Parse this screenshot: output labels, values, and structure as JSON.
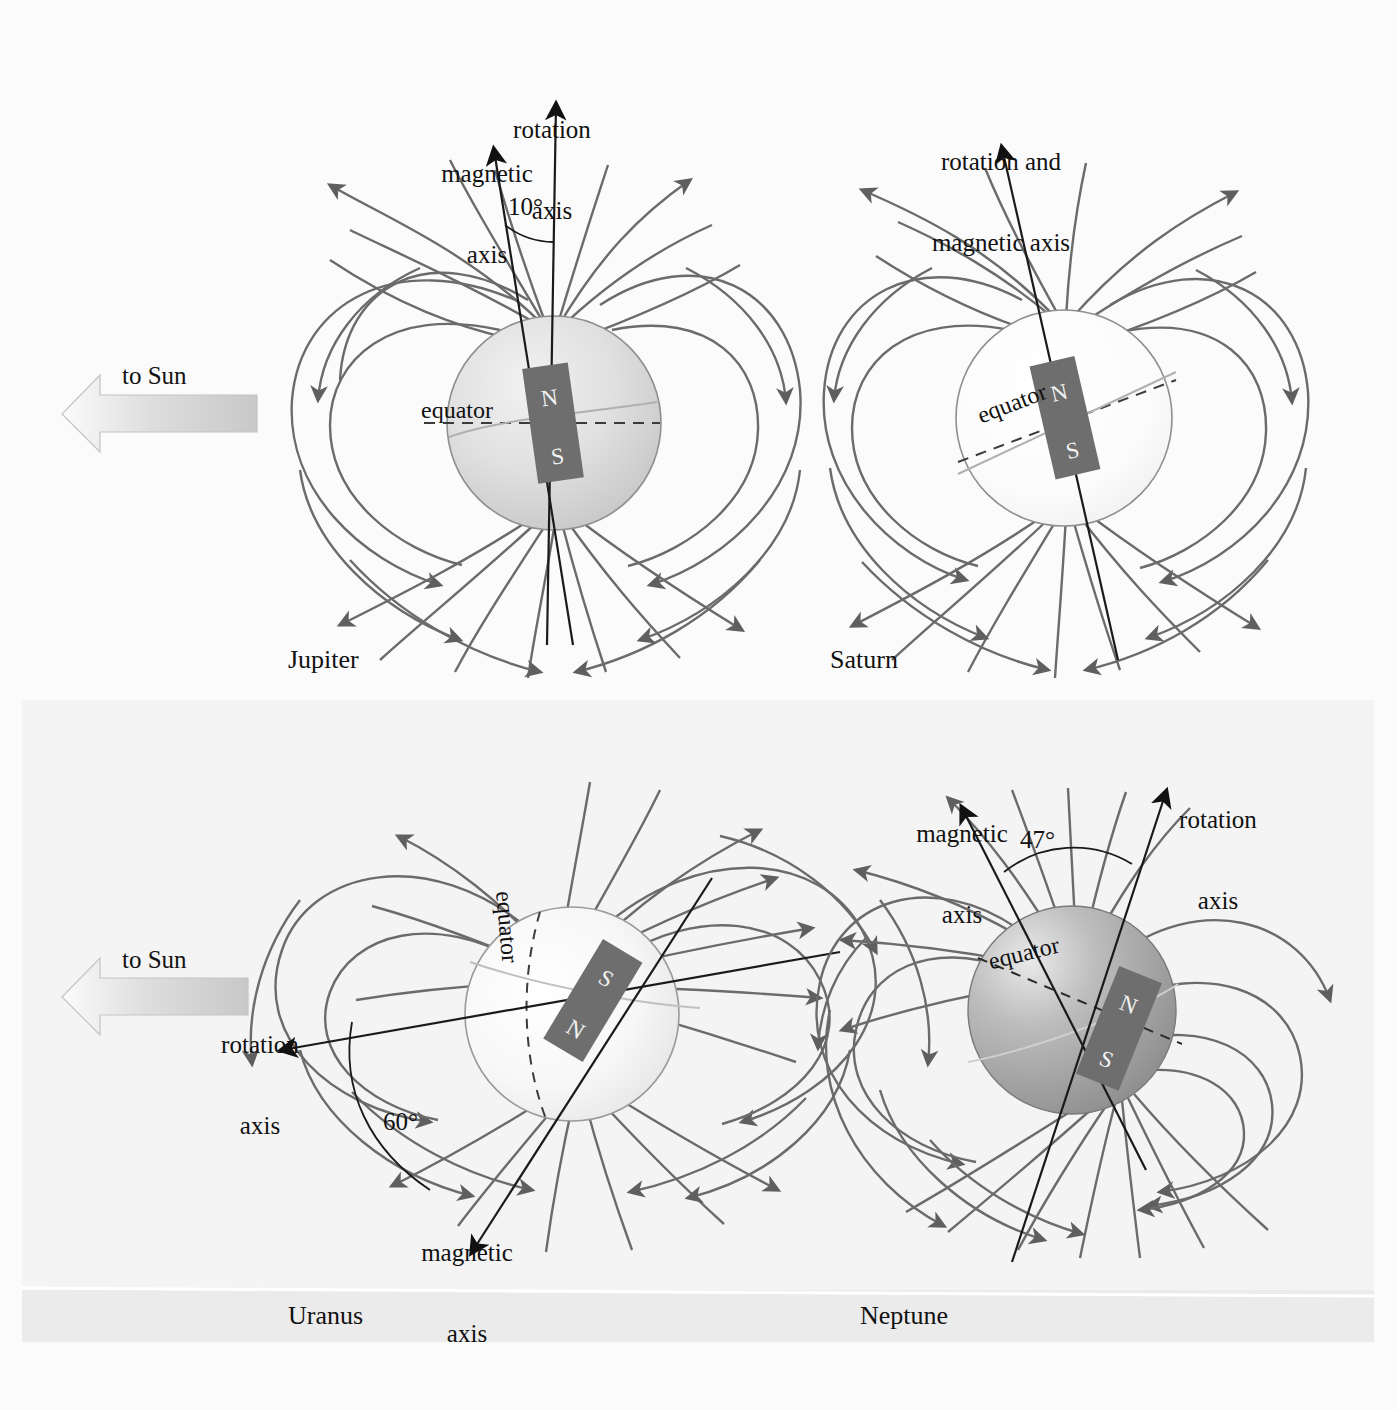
{
  "figure": {
    "background_color": "#fbfbfb",
    "field_line_color": "#6b6b6b",
    "axis_line_color": "#1a1a1a",
    "magnet_color": "#6e6e6e",
    "pole_label_color": "#f2f2f2"
  },
  "sun_arrows": [
    {
      "label": "to Sun",
      "direction": "left"
    },
    {
      "label": "to Sun",
      "direction": "left"
    }
  ],
  "panels": [
    {
      "id": "jupiter",
      "name": "Jupiter",
      "sphere_fill": "light-gray-gradient",
      "equator_label": "equator",
      "poles": {
        "north": "N",
        "south": "S"
      },
      "axes": [
        {
          "name": "rotation axis",
          "label": "rotation\naxis",
          "label_lines": [
            "rotation",
            "axis"
          ]
        },
        {
          "name": "magnetic axis",
          "label": "magnetic\naxis",
          "label_lines": [
            "magnetic",
            "axis"
          ]
        }
      ],
      "tilt_angle": "10°"
    },
    {
      "id": "saturn",
      "name": "Saturn",
      "sphere_fill": "near-white",
      "equator_label": "equator",
      "poles": {
        "north": "N",
        "south": "S"
      },
      "axes": [
        {
          "name": "rotation and magnetic axis",
          "label": "rotation and\nmagnetic axis",
          "label_lines": [
            "rotation and",
            "magnetic axis"
          ]
        }
      ],
      "tilt_angle": ""
    },
    {
      "id": "uranus",
      "name": "Uranus",
      "sphere_fill": "white-gradient",
      "equator_label": "equator",
      "poles": {
        "north": "N",
        "south": "S"
      },
      "axes": [
        {
          "name": "rotation axis",
          "label": "rotation\naxis",
          "label_lines": [
            "rotation",
            "axis"
          ]
        },
        {
          "name": "magnetic axis",
          "label": "magnetic\naxis",
          "label_lines": [
            "magnetic",
            "axis"
          ]
        }
      ],
      "tilt_angle": "60°"
    },
    {
      "id": "neptune",
      "name": "Neptune",
      "sphere_fill": "dark-gray-gradient",
      "equator_label": "equator",
      "poles": {
        "north": "N",
        "south": "S"
      },
      "axes": [
        {
          "name": "magnetic axis",
          "label": "magnetic\naxis",
          "label_lines": [
            "magnetic",
            "axis"
          ]
        },
        {
          "name": "rotation axis",
          "label": "rotation\naxis",
          "label_lines": [
            "rotation",
            "axis"
          ]
        }
      ],
      "tilt_angle": "47°"
    }
  ],
  "text": {
    "jupiter_rotation_l1": "rotation",
    "jupiter_rotation_l2": "axis",
    "jupiter_magnetic_l1": "magnetic",
    "jupiter_magnetic_l2": "axis",
    "jupiter_angle": "10°",
    "jupiter_equator": "equator",
    "jupiter_name": "Jupiter",
    "jupiter_n": "N",
    "jupiter_s": "S",
    "saturn_axis_l1": "rotation and",
    "saturn_axis_l2": "magnetic axis",
    "saturn_equator": "equator",
    "saturn_name": "Saturn",
    "saturn_n": "N",
    "saturn_s": "S",
    "uranus_rotation_l1": "rotation",
    "uranus_rotation_l2": "axis",
    "uranus_magnetic_l1": "magnetic",
    "uranus_magnetic_l2": "axis",
    "uranus_angle": "60°",
    "uranus_equator": "equator",
    "uranus_name": "Uranus",
    "uranus_n": "N",
    "uranus_s": "S",
    "neptune_magnetic_l1": "magnetic",
    "neptune_magnetic_l2": "axis",
    "neptune_rotation_l1": "rotation",
    "neptune_rotation_l2": "axis",
    "neptune_angle": "47°",
    "neptune_equator": "equator",
    "neptune_name": "Neptune",
    "neptune_n": "N",
    "neptune_s": "S",
    "to_sun_top": "to Sun",
    "to_sun_bottom": "to Sun"
  }
}
